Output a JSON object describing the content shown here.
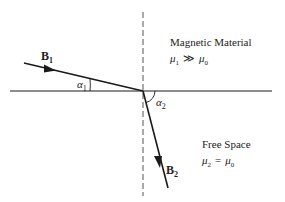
{
  "regions": {
    "upper": {
      "title": "Magnetic Material",
      "relation": {
        "left": "μ",
        "left_sub": "1",
        "op": "≫",
        "right": "μ",
        "right_sub": "0"
      }
    },
    "lower": {
      "title": "Free Space",
      "relation": {
        "left": "μ",
        "left_sub": "2",
        "op": "=",
        "right": "μ",
        "right_sub": "0"
      }
    }
  },
  "vectors": {
    "b1": {
      "symbol": "B",
      "sub": "1"
    },
    "b2": {
      "symbol": "B",
      "sub": "2"
    }
  },
  "angles": {
    "alpha1": {
      "symbol": "α",
      "sub": "1"
    },
    "alpha2": {
      "symbol": "α",
      "sub": "2"
    }
  },
  "colors": {
    "line": "#1a1a1a",
    "dashed": "#555555",
    "text": "#222222"
  }
}
